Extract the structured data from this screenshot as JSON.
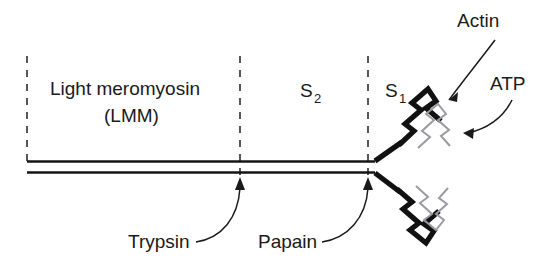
{
  "diagram": {
    "background_color": "#ffffff",
    "ink_color": "#1a1a1a",
    "light_ink_color": "#9a9aa2",
    "regions": [
      {
        "id": "lmm",
        "label_line1": "Light meromyosin",
        "label_line2": "(LMM)",
        "start_x": 27,
        "end_x": 240
      },
      {
        "id": "s2",
        "label_main": "S",
        "label_subscript": "2",
        "start_x": 240,
        "end_x": 368
      },
      {
        "id": "s1",
        "label_main": "S",
        "label_subscript": "1",
        "start_x": 368,
        "end_x": 470
      }
    ],
    "dividers": [
      {
        "id": "divider-left",
        "x": 27,
        "y_top": 56,
        "y_bottom": 162
      },
      {
        "id": "divider-trypsin",
        "x": 240,
        "y_top": 56,
        "y_bottom": 176
      },
      {
        "id": "divider-papain",
        "x": 368,
        "y_top": 56,
        "y_bottom": 176
      }
    ],
    "rod": {
      "top_line_y": 161,
      "bottom_line_y": 172,
      "start_x": 27,
      "end_x": 375
    },
    "heads": [
      {
        "id": "upper-head",
        "position": "upper"
      },
      {
        "id": "lower-head",
        "position": "lower"
      }
    ],
    "callouts": [
      {
        "id": "actin",
        "label": "Actin",
        "label_x": 457,
        "label_y": 27,
        "points_to": "upper-head"
      },
      {
        "id": "atp",
        "label": "ATP",
        "label_x": 490,
        "label_y": 90,
        "points_to": "upper-head-light-zigzag"
      },
      {
        "id": "trypsin",
        "label": "Trypsin",
        "label_x": 128,
        "label_y": 248,
        "points_to": "divider-trypsin"
      },
      {
        "id": "papain",
        "label": "Papain",
        "label_x": 258,
        "label_y": 248,
        "points_to": "divider-papain"
      }
    ]
  }
}
